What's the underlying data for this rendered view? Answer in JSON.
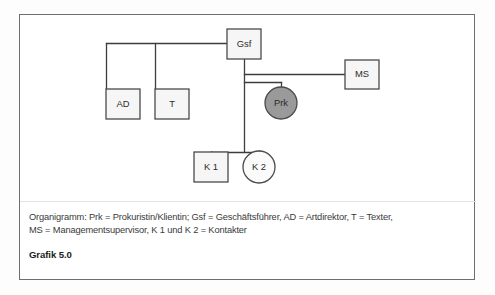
{
  "figure": {
    "label": "Grafik 5.0",
    "caption_lines": [
      "Organigramm: Prk = Prokuristin/Klientin; Gsf = Geschäftsführer, AD = Artdirektor, T = Texter,",
      "MS = Managementsupervisor, K 1 und K 2 = Kontakter"
    ]
  },
  "diagram": {
    "type": "organigram",
    "nodes": [
      {
        "id": "gsf",
        "label": "Gsf",
        "shape": "box",
        "x": 207,
        "y": 14,
        "w": 34,
        "h": 30
      },
      {
        "id": "ms",
        "label": "MS",
        "shape": "box",
        "x": 325,
        "y": 45,
        "w": 34,
        "h": 29
      },
      {
        "id": "prk",
        "label": "Prk",
        "shape": "circle-filled",
        "cx": 261,
        "cy": 88,
        "r": 16
      },
      {
        "id": "ad",
        "label": "AD",
        "shape": "box",
        "x": 86,
        "y": 74,
        "w": 34,
        "h": 30
      },
      {
        "id": "t",
        "label": "T",
        "shape": "box",
        "x": 135,
        "y": 74,
        "w": 34,
        "h": 30
      },
      {
        "id": "k1",
        "label": "K 1",
        "shape": "box",
        "x": 174,
        "y": 137,
        "w": 34,
        "h": 30
      },
      {
        "id": "k2",
        "label": "K 2",
        "shape": "circle-open",
        "cx": 239,
        "cy": 152,
        "r": 16
      }
    ],
    "edges": [
      {
        "from": "gsf",
        "to": "ad",
        "kind": "elbow-left"
      },
      {
        "from": "gsf",
        "to": "t",
        "kind": "elbow-left"
      },
      {
        "from": "gsf",
        "to": "ms",
        "kind": "horizontal-branch"
      },
      {
        "from": "gsf",
        "to": "prk",
        "kind": "horizontal-branch"
      },
      {
        "from": "gsf",
        "to": "k1",
        "kind": "elbow-down"
      },
      {
        "from": "gsf",
        "to": "k2",
        "kind": "elbow-down"
      }
    ],
    "colors": {
      "line": "#3d3d3d",
      "box_fill": "#f6f6f6",
      "box_stroke": "#4b4b4b",
      "highlight_fill": "#9a9a9a",
      "frame": "#6e6e6e"
    }
  }
}
